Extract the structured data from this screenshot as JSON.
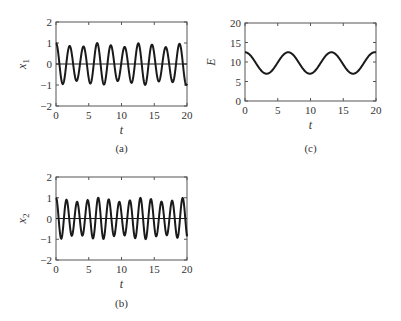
{
  "figure": {
    "background": "#ffffff",
    "line_color": "#1a1a1a",
    "axis_color": "#555555"
  },
  "chart_data": [
    {
      "id": "a",
      "type": "line",
      "caption": "(a)",
      "title": "",
      "xlabel": "t",
      "ylabel": "x1",
      "ylabel_main": "x",
      "ylabel_sub": "1",
      "xlim": [
        0,
        20
      ],
      "ylim": [
        -2,
        2
      ],
      "xticks": [
        0,
        5,
        10,
        15,
        20
      ],
      "yticks": [
        -2,
        -1,
        0,
        1,
        2
      ],
      "zero_line": true,
      "grid": false,
      "series": [
        {
          "name": "x1",
          "description": "oscillation, period about 2.1, amplitude 0.8-1.0",
          "model": {
            "kind": "modsine",
            "omega": 3.0,
            "phase": 0,
            "amp_base": 0.9,
            "amp_mod": 0.1,
            "mod_omega": 0.95
          },
          "peaks_t": [
            0,
            2.1,
            4.2,
            6.3,
            8.4,
            10.5,
            12.6,
            14.6,
            16.7,
            18.8
          ],
          "peaks_y": [
            1.0,
            0.85,
            0.8,
            1.0,
            0.85,
            0.75,
            1.0,
            0.9,
            0.75,
            0.95
          ]
        }
      ],
      "box": {
        "x": 56,
        "y": 22,
        "w": 131,
        "h": 84
      },
      "caption_y": 152
    },
    {
      "id": "c",
      "type": "line",
      "caption": "(c)",
      "title": "",
      "xlabel": "t",
      "ylabel": "E",
      "ylabel_main": "E",
      "ylabel_sub": "",
      "xlim": [
        0,
        20
      ],
      "ylim": [
        0,
        20
      ],
      "xticks": [
        0,
        5,
        10,
        15,
        20
      ],
      "yticks": [
        0,
        5,
        10,
        15,
        20
      ],
      "zero_line": false,
      "grid": false,
      "series": [
        {
          "name": "E",
          "description": "slow oscillation between about 7 and 12.5, period about 6.6",
          "model": {
            "kind": "cosine",
            "mean": 9.75,
            "amp": 2.75,
            "period": 6.6
          },
          "maxima_t": [
            0,
            6.6,
            13.2,
            19.8
          ],
          "minima_t": [
            3.3,
            9.9,
            16.5
          ],
          "max_value": 12.5,
          "min_value": 7.0
        }
      ],
      "box": {
        "x": 245,
        "y": 23,
        "w": 131,
        "h": 78
      },
      "caption_y": 152
    },
    {
      "id": "b",
      "type": "line",
      "caption": "(b)",
      "title": "",
      "xlabel": "t",
      "ylabel": "x2",
      "ylabel_main": "x",
      "ylabel_sub": "2",
      "xlim": [
        0,
        20
      ],
      "ylim": [
        -2,
        2
      ],
      "xticks": [
        0,
        5,
        10,
        15,
        20
      ],
      "yticks": [
        -2,
        -1,
        0,
        1,
        2
      ],
      "zero_line": true,
      "grid": false,
      "series": [
        {
          "name": "x2",
          "description": "faster oscillation, period about 1.6, amplitude 0.8-1.0",
          "model": {
            "kind": "modsine",
            "omega": 3.9,
            "phase": 0,
            "amp_base": 0.9,
            "amp_mod": 0.1,
            "mod_omega": 0.95
          },
          "approx_peak_count": 13
        }
      ],
      "box": {
        "x": 56,
        "y": 177,
        "w": 131,
        "h": 83
      },
      "caption_y": 307
    }
  ]
}
